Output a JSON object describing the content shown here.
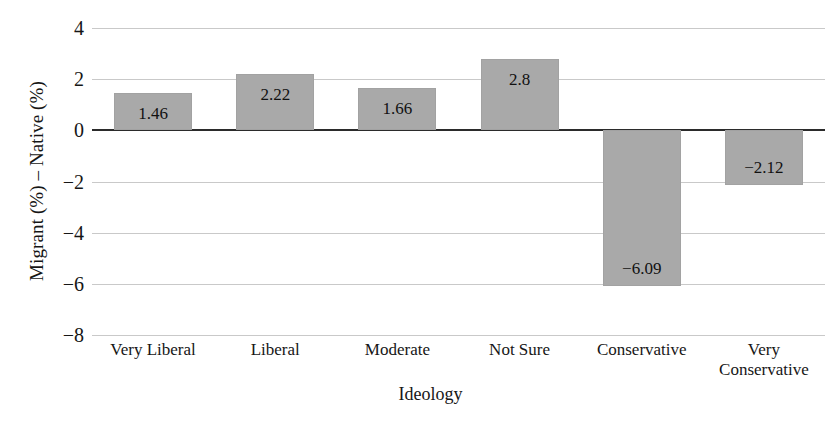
{
  "chart_data": {
    "type": "bar",
    "title": "",
    "xlabel": "Ideology",
    "ylabel": "Migrant (%) – Native (%)",
    "categories": [
      "Very Liberal",
      "Liberal",
      "Moderate",
      "Not Sure",
      "Conservative",
      "Very\nConservative"
    ],
    "values": [
      1.46,
      2.22,
      1.66,
      2.8,
      -6.09,
      -2.12
    ],
    "value_labels": [
      "1.46",
      "2.22",
      "1.66",
      "2.8",
      "−6.09",
      "−2.12"
    ],
    "ylim": [
      -8,
      4
    ],
    "yticks": [
      4,
      2,
      0,
      -2,
      -4,
      -6,
      -8
    ],
    "ytick_labels": [
      "4",
      "2",
      "0",
      "−2",
      "−4",
      "−6",
      "−8"
    ],
    "grid": true,
    "legend": "none",
    "bar_color": "#a9a9a9",
    "gridline_color": "#c9c9c9",
    "zero_line_color": "#2b2b2b",
    "background_color": "#ffffff"
  }
}
